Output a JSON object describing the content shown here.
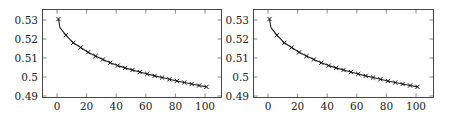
{
  "chart_data": [
    {
      "type": "line",
      "title": "",
      "xlabel": "",
      "ylabel": "",
      "xlim": [
        -10,
        110
      ],
      "ylim": [
        0.49,
        0.5335
      ],
      "x_ticks": [
        0,
        20,
        40,
        60,
        80,
        100
      ],
      "x_tick_labels": [
        "0",
        "20",
        "40",
        "60",
        "80",
        "100"
      ],
      "y_ticks": [
        0.49,
        0.5,
        0.51,
        0.52,
        0.53
      ],
      "y_tick_labels": [
        "0.49",
        "0.5",
        "0.51",
        "0.52",
        "0.53"
      ],
      "grid": false,
      "legend": null,
      "marker": "x",
      "line_color": "#222222",
      "series": [
        {
          "name": "series-1",
          "x": [
            1,
            2,
            6,
            11,
            16,
            21,
            26,
            31,
            36,
            41,
            46,
            51,
            56,
            61,
            66,
            71,
            76,
            81,
            86,
            91,
            96,
            101
          ],
          "y": [
            0.5305,
            0.526,
            0.522,
            0.518,
            0.5155,
            0.513,
            0.511,
            0.5092,
            0.5075,
            0.506,
            0.5048,
            0.5037,
            0.5026,
            0.5016,
            0.5006,
            0.4997,
            0.4988,
            0.4979,
            0.4971,
            0.4963,
            0.4955,
            0.4948
          ],
          "marker_x": [
            1,
            6,
            11,
            16,
            21,
            26,
            31,
            36,
            41,
            46,
            51,
            56,
            61,
            66,
            71,
            76,
            81,
            86,
            91,
            96,
            101
          ]
        }
      ]
    },
    {
      "type": "line",
      "title": "",
      "xlabel": "",
      "ylabel": "",
      "xlim": [
        -10,
        110
      ],
      "ylim": [
        0.49,
        0.5335
      ],
      "x_ticks": [
        0,
        20,
        40,
        60,
        80,
        100
      ],
      "x_tick_labels": [
        "0",
        "20",
        "40",
        "60",
        "80",
        "100"
      ],
      "y_ticks": [
        0.49,
        0.5,
        0.51,
        0.52,
        0.53
      ],
      "y_tick_labels": [
        "0.49",
        "0.5",
        "0.51",
        "0.52",
        "0.53"
      ],
      "grid": false,
      "legend": null,
      "marker": "x",
      "line_color": "#222222",
      "series": [
        {
          "name": "series-1",
          "x": [
            1,
            2,
            6,
            11,
            16,
            21,
            26,
            31,
            36,
            41,
            46,
            51,
            56,
            61,
            66,
            71,
            76,
            81,
            86,
            91,
            96,
            101
          ],
          "y": [
            0.5305,
            0.526,
            0.522,
            0.518,
            0.5155,
            0.513,
            0.511,
            0.5092,
            0.5075,
            0.506,
            0.5048,
            0.5037,
            0.5026,
            0.5016,
            0.5006,
            0.4997,
            0.4988,
            0.4979,
            0.4971,
            0.4963,
            0.4955,
            0.4948
          ],
          "marker_x": [
            1,
            6,
            11,
            16,
            21,
            26,
            31,
            36,
            41,
            46,
            51,
            56,
            61,
            66,
            71,
            76,
            81,
            86,
            91,
            96,
            101
          ]
        }
      ]
    }
  ]
}
